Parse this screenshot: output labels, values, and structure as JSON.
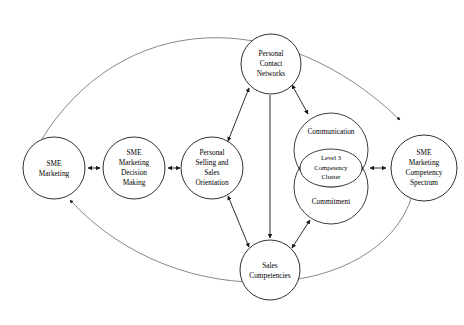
{
  "figure": {
    "type": "conceptual-model-diagram",
    "background_color": "#ffffff",
    "line_color": "#1a1a1a",
    "arc_color": "#555555",
    "width": 464,
    "height": 325
  },
  "nodes": [
    {
      "id": "sme-marketing",
      "lines": [
        "SME",
        "Marketing"
      ],
      "cx": 54,
      "cy": 168,
      "r": 31
    },
    {
      "id": "sme-marketing-decision-making",
      "lines": [
        "SME",
        "Marketing",
        "Decision",
        "Making"
      ],
      "cx": 134,
      "cy": 168,
      "r": 31
    },
    {
      "id": "personal-selling-and-sales-orientation",
      "lines": [
        "Personal",
        "Selling and",
        "Sales",
        "Orientation"
      ],
      "cx": 212,
      "cy": 168,
      "r": 31
    },
    {
      "id": "personal-contact-networks",
      "lines": [
        "Personal",
        "Contact",
        "Networks"
      ],
      "cx": 271,
      "cy": 64,
      "r": 30
    },
    {
      "id": "sales-competencies",
      "lines": [
        "Sales",
        "Competencies"
      ],
      "cx": 270,
      "cy": 270,
      "r": 30
    },
    {
      "id": "sme-marketing-competency-spectrum",
      "lines": [
        "SME",
        "Marketing",
        "Competency",
        "Spectrum"
      ],
      "cx": 424,
      "cy": 168,
      "r": 33
    }
  ],
  "cluster": {
    "id": "level-3-competency-cluster",
    "communication_label": "Communication",
    "commitment_label": "Commitment",
    "inner_lines": [
      "Level 3",
      "Competency",
      "Cluster"
    ],
    "communication": {
      "cx": 331,
      "cy": 150,
      "r": 37
    },
    "commitment": {
      "cx": 331,
      "cy": 187,
      "r": 37
    },
    "inner_ellipse": {
      "cx": 331,
      "cy": 168,
      "rx": 31,
      "ry": 19
    }
  },
  "connectors": [
    {
      "id": "sme-marketing--decision-making",
      "style": "double-arrow",
      "orientation": "horizontal"
    },
    {
      "id": "decision-making--personal-selling",
      "style": "double-arrow",
      "orientation": "horizontal"
    },
    {
      "id": "personal-selling--personal-contact-networks",
      "style": "double-arrow",
      "orientation": "diagonal"
    },
    {
      "id": "personal-selling--sales-competencies",
      "style": "double-arrow",
      "orientation": "diagonal"
    },
    {
      "id": "personal-contact-networks--sales-competencies",
      "style": "single-arrow-down",
      "orientation": "vertical"
    },
    {
      "id": "personal-contact-networks--communication",
      "style": "double-arrow",
      "orientation": "diagonal"
    },
    {
      "id": "commitment--sales-competencies",
      "style": "double-arrow",
      "orientation": "diagonal"
    },
    {
      "id": "cluster--competency-spectrum",
      "style": "double-arrow",
      "orientation": "horizontal"
    },
    {
      "id": "top-feedback-arc",
      "style": "single-arrow",
      "orientation": "arc-top",
      "from": "sme-marketing",
      "to": "sme-marketing-competency-spectrum"
    },
    {
      "id": "bottom-feedback-arc",
      "style": "single-arrow",
      "orientation": "arc-bottom",
      "from": "sme-marketing-competency-spectrum",
      "to": "sme-marketing"
    }
  ]
}
